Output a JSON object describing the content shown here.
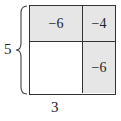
{
  "diagram": {
    "type": "area-model-grid",
    "cells": {
      "top_left": {
        "value": "−6",
        "shaded": true
      },
      "top_right": {
        "value": "−4",
        "shaded": true
      },
      "bottom_left": {
        "value": "",
        "shaded": false
      },
      "bottom_right": {
        "value": "−6",
        "shaded": true
      }
    },
    "left_label": "5",
    "bottom_label": "3",
    "colors": {
      "shade": "#e6e6e6",
      "line": "#333333"
    }
  }
}
